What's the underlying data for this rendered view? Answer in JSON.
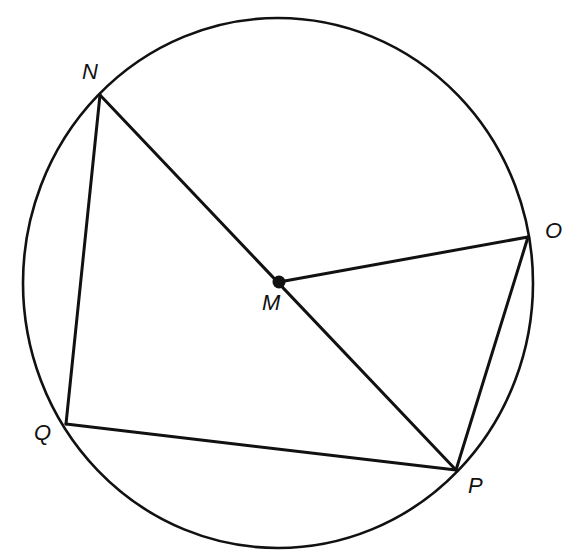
{
  "diagram": {
    "type": "circle-geometry",
    "colors": {
      "stroke": "#111111",
      "background": "#ffffff"
    },
    "circle": {
      "center": "M",
      "cx": 278,
      "cy": 283,
      "rx": 255,
      "ry": 265
    },
    "points": [
      {
        "id": "N",
        "label": "N",
        "x": 100,
        "y": 95,
        "label_x": 82,
        "label_y": 79
      },
      {
        "id": "O",
        "label": "O",
        "x": 528,
        "y": 237,
        "label_x": 545,
        "label_y": 238
      },
      {
        "id": "M",
        "label": "M",
        "x": 279,
        "y": 282,
        "label_x": 262,
        "label_y": 310
      },
      {
        "id": "P",
        "label": "P",
        "x": 456,
        "y": 470,
        "label_x": 468,
        "label_y": 493
      },
      {
        "id": "Q",
        "label": "Q",
        "x": 66,
        "y": 424,
        "label_x": 34,
        "label_y": 440
      }
    ],
    "segments": [
      {
        "from": "N",
        "to": "P",
        "name": "diameter-NP"
      },
      {
        "from": "M",
        "to": "O",
        "name": "radius-MO"
      },
      {
        "from": "N",
        "to": "Q",
        "name": "chord-NQ"
      },
      {
        "from": "Q",
        "to": "P",
        "name": "chord-QP"
      },
      {
        "from": "O",
        "to": "P",
        "name": "chord-OP"
      }
    ]
  }
}
